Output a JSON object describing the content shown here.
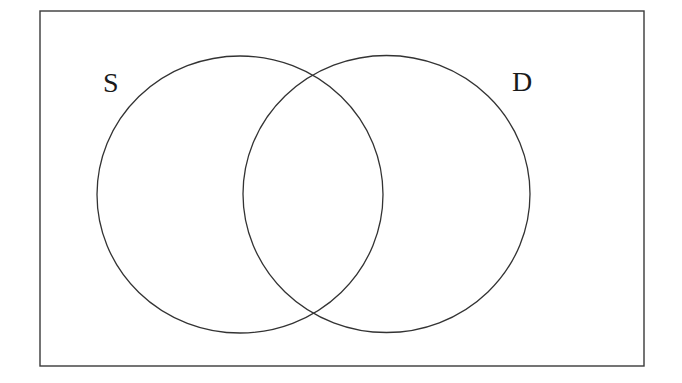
{
  "diagram": {
    "type": "venn",
    "title": "",
    "universe": {
      "label": ""
    },
    "sets": [
      {
        "id": "S",
        "label": "S"
      },
      {
        "id": "D",
        "label": "D"
      }
    ],
    "regions_shaded": [],
    "colors": {
      "stroke": "#333333",
      "background": "#ffffff",
      "label": "#1a1a1a"
    }
  }
}
